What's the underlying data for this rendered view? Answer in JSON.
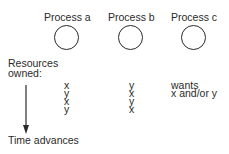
{
  "processes": [
    {
      "label": "Process a"
    },
    {
      "label": "Process b"
    },
    {
      "label": "Process c"
    }
  ],
  "resources_label": [
    "Resources",
    "owned:"
  ],
  "rows": [
    {
      "a": "x",
      "b": "y",
      "c": "wants"
    },
    {
      "a": "y",
      "b": "x",
      "c": "x and/or y"
    },
    {
      "a": "x",
      "b": "y",
      "c": ""
    },
    {
      "a": "y",
      "b": "x",
      "c": ""
    }
  ],
  "time_label": "Time advances"
}
